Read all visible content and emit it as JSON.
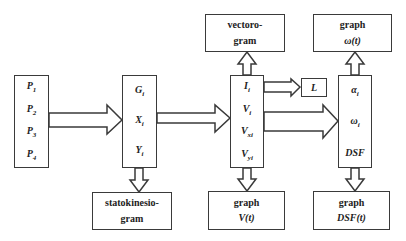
{
  "diagram": {
    "input_box": {
      "items": [
        "P1",
        "P2",
        "P3",
        "P4"
      ]
    },
    "gxy_box": {
      "items": [
        "Gi",
        "Xi",
        "Yi"
      ]
    },
    "velocity_box": {
      "items": [
        "Ii",
        "Vi",
        "Vxi",
        "Vyi"
      ]
    },
    "angle_box": {
      "items": [
        "αi",
        "ωi",
        "DSF"
      ]
    },
    "l_box": {
      "label": "L"
    },
    "statokinesiogram_box": {
      "line1": "statokinesio-",
      "line2": "gram"
    },
    "vectorogram_box": {
      "line1": "vectoro-",
      "line2": "gram"
    },
    "graph_omega_box": {
      "line1": "graph",
      "line2": "ω(t)"
    },
    "graph_v_box": {
      "line1": "graph",
      "line2": "V(t)"
    },
    "graph_dsf_box": {
      "line1": "graph",
      "line2": "DSF(t)"
    }
  },
  "colors": {
    "stroke": "#3a3a3a",
    "background": "#ffffff",
    "text": "#222222"
  }
}
